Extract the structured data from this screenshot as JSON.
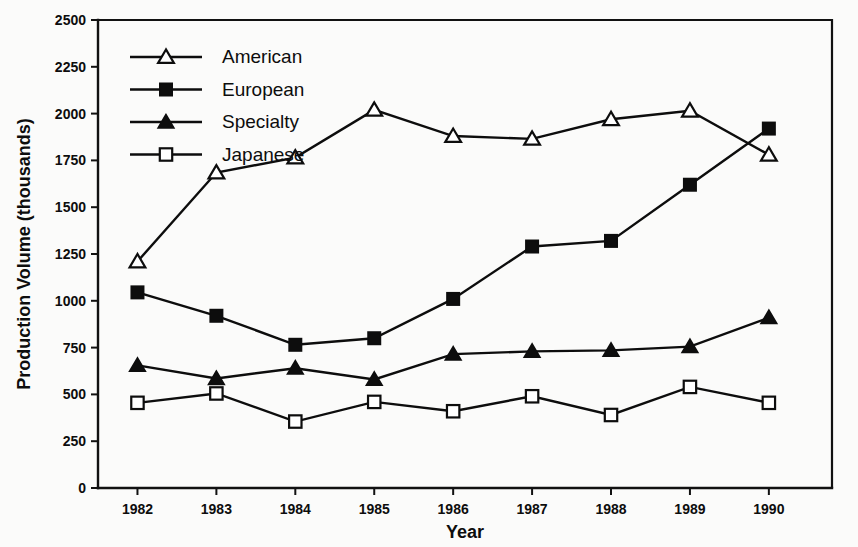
{
  "chart_data": {
    "type": "line",
    "title": "",
    "subtitle": "",
    "xlabel": "Year",
    "ylabel": "Production Volume (thousands)",
    "x": [
      1982,
      1983,
      1984,
      1985,
      1986,
      1987,
      1988,
      1989,
      1990
    ],
    "xticklabels": [
      "1982",
      "1983",
      "1984",
      "1985",
      "1986",
      "1987",
      "1988",
      "1989",
      "1990"
    ],
    "xlim": [
      1981.5,
      1990.8
    ],
    "ylim": [
      0,
      2500
    ],
    "yticks": [
      0,
      250,
      500,
      750,
      1000,
      1250,
      1500,
      1750,
      2000,
      2250,
      2500
    ],
    "yticklabels": [
      "0",
      "250",
      "500",
      "750",
      "1000",
      "1250",
      "1500",
      "1750",
      "2000",
      "2250",
      "2500"
    ],
    "grid": false,
    "legend_position": "upper-left-inside",
    "series": [
      {
        "name": "American",
        "marker": "open-triangle",
        "values": [
          1210,
          1685,
          1765,
          2020,
          1880,
          1865,
          1970,
          2015,
          1780
        ]
      },
      {
        "name": "European",
        "marker": "filled-square",
        "values": [
          1045,
          920,
          765,
          800,
          1010,
          1290,
          1320,
          1620,
          1920
        ]
      },
      {
        "name": "Specialty",
        "marker": "filled-triangle",
        "values": [
          655,
          585,
          640,
          580,
          715,
          730,
          735,
          755,
          910
        ]
      },
      {
        "name": "Japanese",
        "marker": "open-square",
        "values": [
          455,
          505,
          355,
          460,
          410,
          490,
          390,
          540,
          455
        ]
      }
    ],
    "colors": {
      "line": "#0d0d0d",
      "marker_fill": "#0d0d0d",
      "marker_open_fill": "#ffffff",
      "background": "#fbfbfa",
      "axis": "#111111"
    }
  },
  "legend": {
    "entries": [
      {
        "label": "American",
        "marker": "open-triangle"
      },
      {
        "label": "European",
        "marker": "filled-square"
      },
      {
        "label": "Specialty",
        "marker": "filled-triangle"
      },
      {
        "label": "Japanese",
        "marker": "open-square"
      }
    ]
  }
}
